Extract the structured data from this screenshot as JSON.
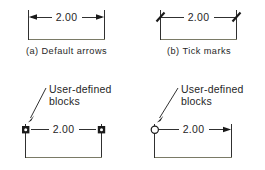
{
  "drawing": {
    "title": "Dimension arrowhead styles",
    "dimension_value": "2.00",
    "line_color": "#1a1a1a",
    "base_line_color": "#7a7a66",
    "text_color": "#262626"
  },
  "figures": [
    {
      "id": "fig-a",
      "caption": "(a)  Default arrows",
      "dimension_text": "2.00",
      "left_terminator": "closed-filled-arrow",
      "right_terminator": "closed-filled-arrow",
      "annotation": null
    },
    {
      "id": "fig-b",
      "caption": "(b)  Tick marks",
      "dimension_text": "2.00",
      "left_terminator": "oblique-tick",
      "right_terminator": "oblique-tick",
      "annotation": null
    },
    {
      "id": "fig-c",
      "caption": "",
      "dimension_text": "2.00",
      "left_terminator": "square-block",
      "right_terminator": "square-block",
      "annotation": {
        "line1": "User-defined",
        "line2": "blocks",
        "points_to": "left-terminator"
      }
    },
    {
      "id": "fig-d",
      "caption": "",
      "dimension_text": "2.00",
      "left_terminator": "circle-block",
      "right_terminator": "closed-filled-arrow",
      "annotation": {
        "line1": "User-defined",
        "line2": "blocks",
        "points_to": "left-terminator"
      }
    }
  ]
}
